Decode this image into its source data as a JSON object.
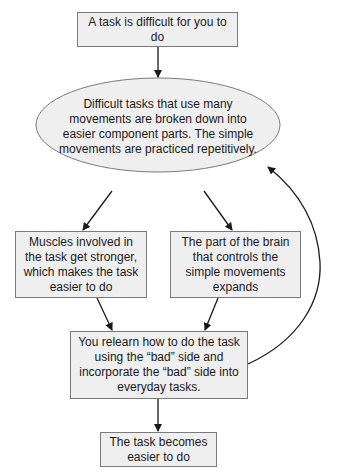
{
  "diagram": {
    "type": "flowchart",
    "colors": {
      "node_fill": "#efefef",
      "node_border": "#7a7a7a",
      "ellipse_fill": "#efefef",
      "arrow": "#1a1a1a",
      "text": "#1a1a1a"
    },
    "nodes": [
      {
        "id": "start",
        "shape": "rectangle",
        "text": "A task is difficult for you to do"
      },
      {
        "id": "breakdown",
        "shape": "ellipse",
        "text": "Difficult tasks that use many movements are broken down into easier component parts. The simple movements are practiced repetitively."
      },
      {
        "id": "muscles",
        "shape": "rectangle",
        "text": "Muscles involved in the task get stronger, which makes the task easier to do"
      },
      {
        "id": "brain",
        "shape": "rectangle",
        "text": "The part of the brain that controls the simple movements expands"
      },
      {
        "id": "relearn",
        "shape": "rectangle",
        "text": "You relearn how to do the task using the “bad” side and incorporate the “bad” side into everyday tasks."
      },
      {
        "id": "end",
        "shape": "rectangle",
        "text": "The task becomes easier to do"
      }
    ],
    "edges": [
      {
        "from": "start",
        "to": "breakdown"
      },
      {
        "from": "breakdown",
        "to": "muscles"
      },
      {
        "from": "breakdown",
        "to": "brain"
      },
      {
        "from": "muscles",
        "to": "relearn"
      },
      {
        "from": "brain",
        "to": "relearn"
      },
      {
        "from": "relearn",
        "to": "end"
      },
      {
        "from": "relearn",
        "to": "breakdown",
        "style": "curved-feedback"
      }
    ]
  }
}
